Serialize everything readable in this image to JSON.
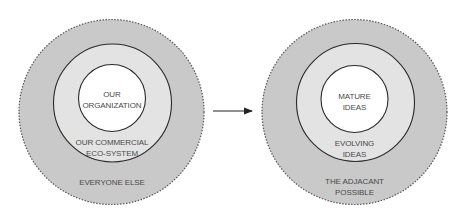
{
  "colors": {
    "outer_fill": "#c9c9c9",
    "outer_stroke": "#555555",
    "middle_fill": "#e3e3e3",
    "middle_stroke": "#2a2a2a",
    "inner_fill": "#ffffff",
    "inner_stroke": "#2a2a2a",
    "text": "#4a4a4a",
    "arrow": "#222222"
  },
  "left_diagram": {
    "inner_label": [
      "OUR",
      "ORGANIZATION"
    ],
    "middle_label": [
      "OUR COMMERCIAL",
      "ECO-SYSTEM"
    ],
    "outer_label": [
      "EVERYONE ELSE"
    ]
  },
  "arrow": {
    "direction": "right"
  },
  "right_diagram": {
    "inner_label": [
      "MATURE",
      "IDEAS"
    ],
    "middle_label": [
      "EVOLVING",
      "IDEAS"
    ],
    "outer_label": [
      "THE ADJACANT",
      "POSSIBLE"
    ]
  }
}
